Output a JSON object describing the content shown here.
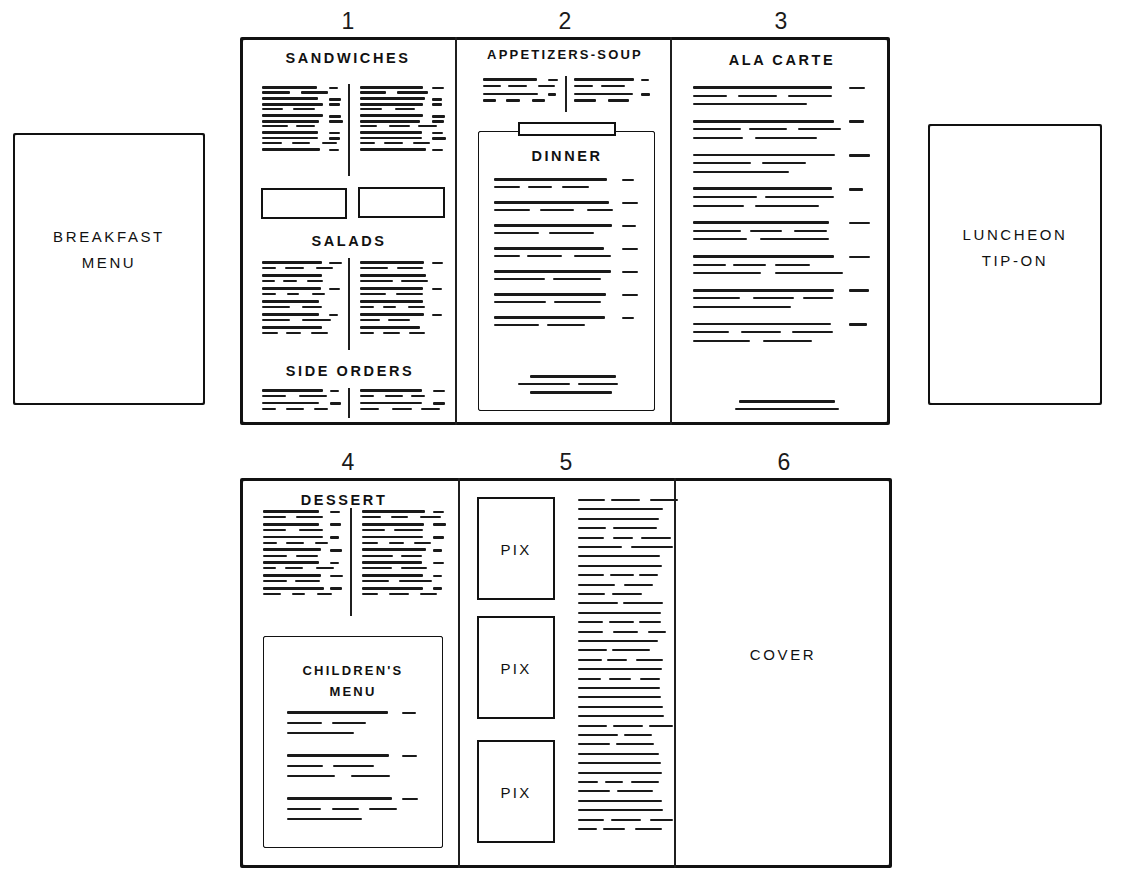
{
  "diagram": {
    "style": "hand-drawn pencil sketch, black ink on white"
  },
  "standalone_panels": [
    {
      "name": "breakfast-menu",
      "label_line1": "BREAKFAST",
      "label_line2": "MENU",
      "x": 13,
      "y": 133,
      "w": 192,
      "h": 272
    },
    {
      "name": "luncheon-tip-on",
      "label_line1": "LUNCHEON",
      "label_line2": "TIP-ON",
      "x": 928,
      "y": 124,
      "w": 174,
      "h": 281
    }
  ],
  "top_row": {
    "x": 240,
    "y": 37,
    "w": 650,
    "h": 388,
    "dividers_x": [
      455,
      670
    ],
    "panels": [
      {
        "number": "1",
        "number_x": 348,
        "number_y": 12,
        "sections": [
          {
            "heading": "SANDWICHES",
            "columns": 2
          },
          {
            "heading": "SALADS",
            "columns": 2
          },
          {
            "heading": "SIDE ORDERS",
            "columns": 2
          }
        ],
        "blank_boxes": 2
      },
      {
        "number": "2",
        "number_x": 565,
        "number_y": 12,
        "sections": [
          {
            "heading": "APPETIZERS-SOUP",
            "columns": 2
          }
        ],
        "inset": {
          "heading": "DINNER",
          "has_tab": true
        }
      },
      {
        "number": "3",
        "number_x": 781,
        "number_y": 12,
        "sections": [
          {
            "heading": "ALA CARTE",
            "columns": 1
          }
        ]
      }
    ]
  },
  "bottom_row": {
    "x": 240,
    "y": 478,
    "w": 652,
    "h": 390,
    "dividers_x": [
      458,
      674
    ],
    "panels": [
      {
        "number": "4",
        "number_x": 348,
        "number_y": 453,
        "sections": [
          {
            "heading": "DESSERT",
            "columns": 2
          }
        ],
        "inset": {
          "heading_line1": "CHILDREN'S",
          "heading_line2": "MENU"
        }
      },
      {
        "number": "5",
        "number_x": 566,
        "number_y": 453,
        "pix_boxes": [
          {
            "label": "PIX"
          },
          {
            "label": "PIX"
          },
          {
            "label": "PIX"
          }
        ],
        "text_column": true
      },
      {
        "number": "6",
        "number_x": 784,
        "number_y": 453,
        "label": "COVER"
      }
    ]
  },
  "colors": {
    "ink": "#141414",
    "paper": "#ffffff"
  }
}
